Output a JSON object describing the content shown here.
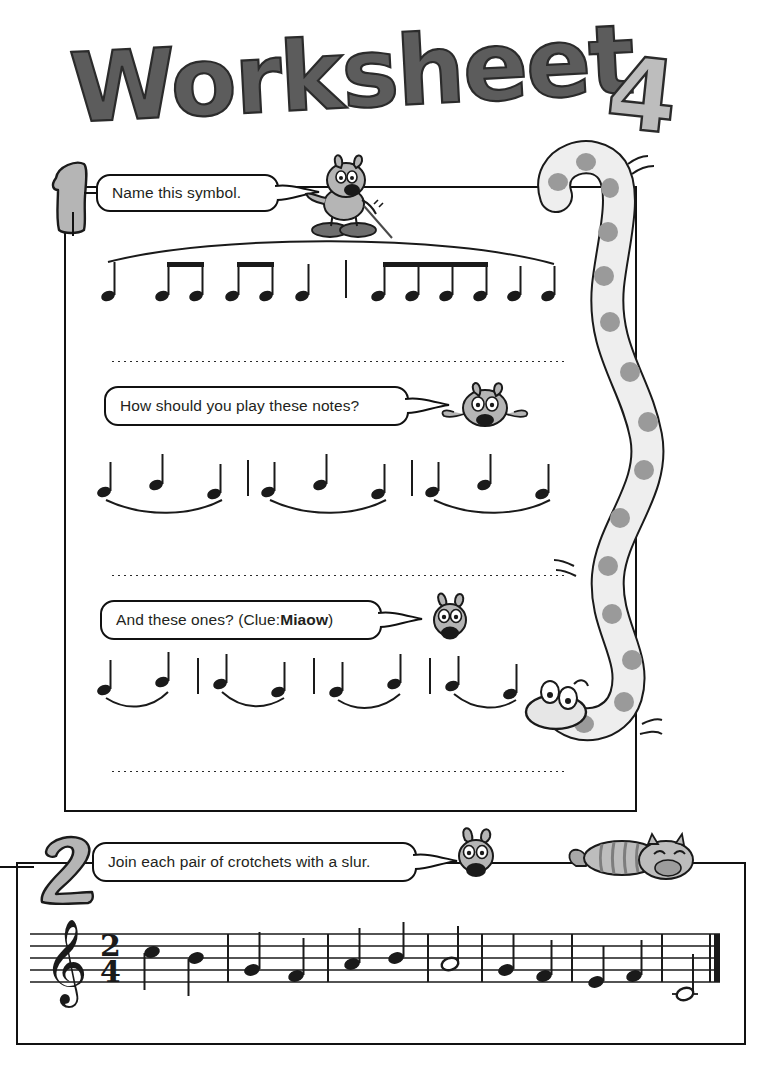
{
  "page": {
    "title": "Worksheet 4",
    "title_word": "Worksheet",
    "title_number": "4",
    "background_color": "#ffffff",
    "ink_color": "#111111",
    "figure_fill": "#b5b5b5",
    "figure_fill_light": "#d9d9d9",
    "title_fill": "#5c5c5c",
    "title_number_fill": "#bdbdbd"
  },
  "questions": [
    {
      "number": "1",
      "prompts": [
        {
          "id": "prompt-name-symbol",
          "text": "Name this symbol.",
          "bold_part": ""
        },
        {
          "id": "prompt-how-play",
          "text": "How should you play these notes?",
          "bold_part": ""
        },
        {
          "id": "prompt-and-these",
          "text_before": "And these ones? (Clue: ",
          "bold_part": "Miaow",
          "text_after": ")"
        }
      ],
      "answer_lines": [
        "",
        "",
        ""
      ]
    },
    {
      "number": "2",
      "prompts": [
        {
          "id": "prompt-join-slur",
          "text": "Join each pair of crotchets with a slur.",
          "bold_part": ""
        }
      ]
    }
  ],
  "music": {
    "row1": {
      "label": "phrase-mark-example",
      "slur_type": "long-phrase-mark-above",
      "groups": [
        {
          "notes": [
            "crotchet"
          ],
          "beamed": false
        },
        {
          "notes": [
            "quaver",
            "quaver"
          ],
          "beamed": true
        },
        {
          "notes": [
            "quaver",
            "quaver"
          ],
          "beamed": true
        },
        {
          "notes": [
            "crotchet"
          ],
          "beamed": false
        },
        {
          "barline": true
        },
        {
          "notes": [
            "quaver",
            "quaver",
            "quaver",
            "quaver"
          ],
          "beamed": true
        },
        {
          "notes": [
            "crotchet"
          ],
          "beamed": false
        },
        {
          "notes": [
            "crotchet"
          ],
          "beamed": false
        }
      ]
    },
    "row2": {
      "label": "three-note-slur-groups",
      "slur_type": "slur-below",
      "groups": [
        {
          "notes": [
            "crotchet",
            "crotchet",
            "crotchet"
          ],
          "barline_before": false
        },
        {
          "notes": [
            "crotchet",
            "crotchet",
            "crotchet"
          ],
          "barline_before": true
        },
        {
          "notes": [
            "crotchet",
            "crotchet",
            "crotchet"
          ],
          "barline_before": true
        }
      ]
    },
    "row3": {
      "label": "two-note-slur-pairs",
      "slur_type": "slur-below",
      "groups": [
        {
          "notes": [
            "crotchet",
            "crotchet"
          ],
          "barline_before": false
        },
        {
          "notes": [
            "crotchet",
            "crotchet"
          ],
          "barline_before": true
        },
        {
          "notes": [
            "crotchet",
            "crotchet"
          ],
          "barline_before": true
        },
        {
          "notes": [
            "crotchet",
            "crotchet"
          ],
          "barline_before": true
        }
      ]
    },
    "staff": {
      "clef": "treble",
      "time_signature": {
        "top": "2",
        "bottom": "4"
      },
      "bars": [
        {
          "notes": [
            {
              "type": "crotchet",
              "step": 5
            },
            {
              "type": "crotchet",
              "step": 4
            }
          ]
        },
        {
          "notes": [
            {
              "type": "crotchet",
              "step": 2
            },
            {
              "type": "crotchet",
              "step": 1
            }
          ]
        },
        {
          "notes": [
            {
              "type": "crotchet",
              "step": 3
            },
            {
              "type": "crotchet",
              "step": 4
            }
          ]
        },
        {
          "notes": [
            {
              "type": "minim",
              "step": 3
            }
          ]
        },
        {
          "notes": [
            {
              "type": "crotchet",
              "step": 2
            },
            {
              "type": "crotchet",
              "step": 1
            }
          ]
        },
        {
          "notes": [
            {
              "type": "crotchet",
              "step": 0
            },
            {
              "type": "crotchet",
              "step": -1
            }
          ]
        },
        {
          "notes": [
            {
              "type": "crotchet",
              "step": 0
            },
            {
              "type": "crotchet",
              "step": -1
            }
          ]
        },
        {
          "notes": [
            {
              "type": "minim",
              "step": -3,
              "ledger": true
            }
          ]
        }
      ],
      "end_barline": "final-double"
    }
  },
  "characters": [
    {
      "name": "pointing-dog-character",
      "pose": "standing-with-pointer"
    },
    {
      "name": "flat-dog-character",
      "pose": "splat-flat"
    },
    {
      "name": "small-dog-head-character",
      "pose": "head-only"
    },
    {
      "name": "dog-head-character",
      "pose": "head-only"
    },
    {
      "name": "sleeping-cat",
      "pose": "curled-asleep"
    },
    {
      "name": "spotted-snake",
      "pose": "winding-vertical"
    }
  ]
}
